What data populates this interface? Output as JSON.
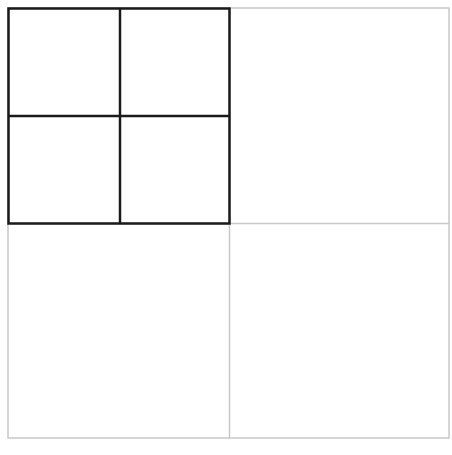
{
  "diagram": {
    "type": "nested-grid",
    "outer_grid": {
      "rows": 2,
      "cols": 2,
      "x": 8,
      "y": 8,
      "width": 441,
      "height": 430,
      "divider_x": 229.5,
      "divider_y": 223.5,
      "stroke": "#c8c8c8",
      "stroke_width": 1.5
    },
    "inner_grid": {
      "rows": 2,
      "cols": 2,
      "x": 8.5,
      "y": 8.5,
      "width": 221,
      "height": 215,
      "divider_x": 120,
      "divider_y": 116,
      "stroke": "#1a1a1a",
      "stroke_width": 2.5
    },
    "background": "#ffffff"
  }
}
